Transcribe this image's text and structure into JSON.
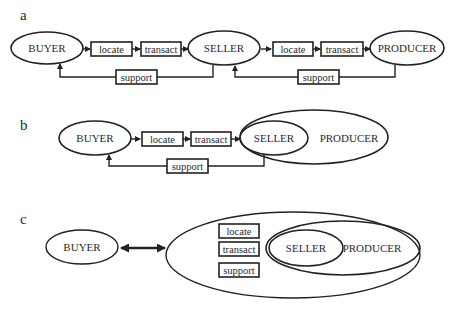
{
  "figure": {
    "panels": [
      {
        "label": "a",
        "nodes": {
          "buyer": "BUYER",
          "seller": "SELLER",
          "producer": "PRODUCER"
        },
        "steps_1": {
          "locate": "locate",
          "transact": "transact",
          "support": "support"
        },
        "steps_2": {
          "locate": "locate",
          "transact": "transact",
          "support": "support"
        }
      },
      {
        "label": "b",
        "nodes": {
          "buyer": "BUYER",
          "seller": "SELLER",
          "producer": "PRODUCER"
        },
        "steps": {
          "locate": "locate",
          "transact": "transact",
          "support": "support"
        }
      },
      {
        "label": "c",
        "nodes": {
          "buyer": "BUYER",
          "seller": "SELLER",
          "producer": "PRODUCER"
        },
        "steps": {
          "locate": "locate",
          "transact": "transact",
          "support": "support"
        }
      }
    ],
    "colors": {
      "line": "#222222",
      "text": "#2a2a2a",
      "background": "#ffffff"
    }
  }
}
